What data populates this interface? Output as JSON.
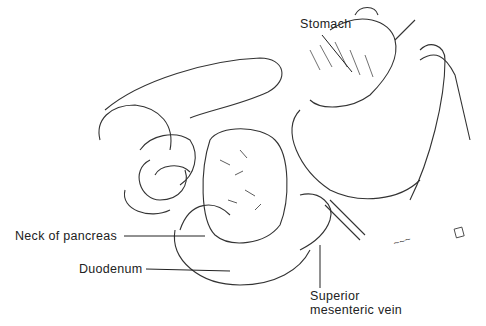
{
  "figure": {
    "type": "anatomical line illustration",
    "labels": {
      "stomach": "Stomach",
      "neck_of_pancreas": "Neck of pancreas",
      "duodenum": "Duodenum",
      "smv_line1": "Superior",
      "smv_line2": "mesenteric vein"
    }
  },
  "colors": {
    "ink": "#222222",
    "background": "#ffffff"
  }
}
